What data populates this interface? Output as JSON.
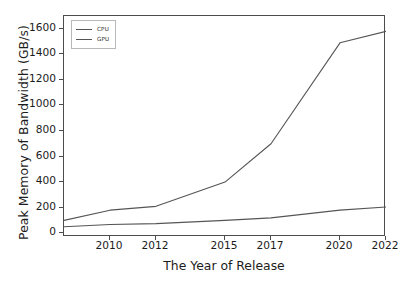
{
  "chart_data": {
    "type": "line",
    "title": "",
    "xlabel": "The Year of Release",
    "ylabel": "Peak Memory of Bandwidth (GB/s)",
    "xlim": [
      2008,
      2022
    ],
    "ylim": [
      -30,
      1700
    ],
    "grid": false,
    "legend_position": "upper left",
    "xticks": [
      "2010",
      "2012",
      "2015",
      "2017",
      "2020",
      "2022"
    ],
    "xtick_values": [
      2010,
      2012,
      2015,
      2017,
      2020,
      2022
    ],
    "yticks": [
      "0",
      "200",
      "400",
      "600",
      "800",
      "1000",
      "1200",
      "1400",
      "1600"
    ],
    "ytick_values": [
      0,
      200,
      400,
      600,
      800,
      1000,
      1200,
      1400,
      1600
    ],
    "x": [
      2008,
      2010,
      2012,
      2015,
      2017,
      2020,
      2022
    ],
    "series": [
      {
        "name": "CPU",
        "color": "#555555",
        "values": [
          100,
          180,
          210,
          400,
          700,
          1490,
          1580
        ]
      },
      {
        "name": "GPU",
        "color": "#555555",
        "values": [
          50,
          68,
          75,
          100,
          120,
          180,
          205
        ]
      }
    ]
  },
  "legend": {
    "items": [
      {
        "label": "CPU"
      },
      {
        "label": "GPU"
      }
    ]
  },
  "axes": {
    "line_color": "#4c4c4c",
    "text_color": "#1c1c1c"
  }
}
